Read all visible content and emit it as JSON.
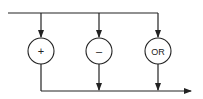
{
  "diagram": {
    "type": "flow-diagram",
    "stroke_color": "#222222",
    "background": "#ffffff",
    "input_line": {
      "x1": 8,
      "y": 13,
      "x2": 158
    },
    "output_line": {
      "x1": 41,
      "y": 91,
      "x2": 190,
      "arrow": true
    },
    "nodes": [
      {
        "id": "plus",
        "label": "+",
        "cx": 41,
        "cy": 51,
        "r": 13,
        "input_arrow": true,
        "output_arrow": false
      },
      {
        "id": "minus",
        "label": "–",
        "cx": 99,
        "cy": 51,
        "r": 13,
        "input_arrow": true,
        "output_arrow": true
      },
      {
        "id": "or",
        "label": "OR",
        "cx": 158,
        "cy": 51,
        "r": 13,
        "input_arrow": true,
        "output_arrow": true
      }
    ]
  }
}
